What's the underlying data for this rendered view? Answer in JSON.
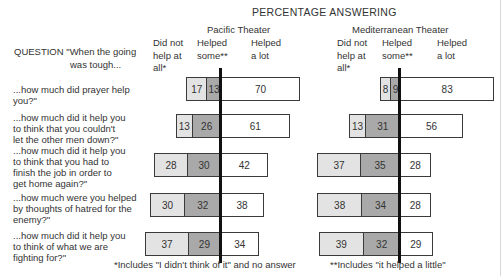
{
  "chart_data": {
    "type": "bar",
    "subtype": "diverging-stacked-horizontal",
    "title": "PERCENTAGE ANSWERING",
    "question_header": [
      "QUESTION \"When the going",
      "was tough..."
    ],
    "categories": [
      "...how much did prayer help you?\"",
      "...how much did it help you to think that you couldn't let the other men down?\"",
      "...how much did it help you to think that you had to finish the job in order to get home again?\"",
      "...how much were you helped by thoughts of hatred for the enemy?\"",
      "...how much did it help you to think of what we are fighting for?\""
    ],
    "category_lines": [
      [
        "...how much did prayer help you?\""
      ],
      [
        "...how much did it help you",
        "to think that you couldn't",
        "let the other men down?\""
      ],
      [
        "...how much did it help you",
        "to think that you had to",
        "finish the job in order to",
        "get home again?\""
      ],
      [
        "...how much were you helped",
        "by thoughts of hatred for the",
        "enemy?\""
      ],
      [
        "...how much did it help you",
        "to think of what we are",
        "fighting for?\""
      ]
    ],
    "legend": [
      {
        "key": "did_not_help",
        "label": "Did not help at all*",
        "lines": [
          "Did not",
          "help at",
          "all*"
        ],
        "color": "#e3e3e3"
      },
      {
        "key": "helped_some",
        "label": "Helped some**",
        "lines": [
          "Helped",
          "some**"
        ],
        "color": "#a9a9a9"
      },
      {
        "key": "helped_a_lot",
        "label": "Helped a lot",
        "lines": [
          "Helped",
          "a lot"
        ],
        "color": "#ffffff"
      }
    ],
    "panels": [
      {
        "name": "Pacific Theater",
        "series": [
          {
            "name": "Did not help at all*",
            "values": [
              17,
              13,
              28,
              30,
              37
            ]
          },
          {
            "name": "Helped some**",
            "values": [
              13,
              26,
              30,
              32,
              29
            ]
          },
          {
            "name": "Helped a lot",
            "values": [
              70,
              61,
              42,
              38,
              34
            ]
          }
        ]
      },
      {
        "name": "Mediterranean Theater",
        "series": [
          {
            "name": "Did not help at all*",
            "values": [
              8,
              13,
              37,
              38,
              39
            ]
          },
          {
            "name": "Helped some**",
            "values": [
              9,
              31,
              35,
              34,
              32
            ]
          },
          {
            "name": "Helped a lot",
            "values": [
              83,
              56,
              28,
              28,
              29
            ]
          }
        ]
      }
    ],
    "footnotes": [
      "*Includes \"I didn't think of it\" and no answer",
      "**Includes \"it helped a little\""
    ],
    "xlabel": "",
    "ylabel": "",
    "unit": "percent",
    "grid": false,
    "legend_position": "top (column headers)"
  }
}
